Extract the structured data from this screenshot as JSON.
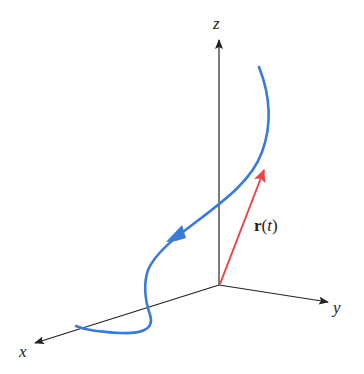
{
  "figure": {
    "axes": {
      "x_label": "x",
      "y_label": "y",
      "z_label": "z"
    },
    "vector_label": {
      "bold": "r",
      "open": "(",
      "param": "t",
      "close": ")"
    },
    "colors": {
      "axis": "#222222",
      "curve": "#3a7bd5",
      "vector": "#e8474a"
    }
  }
}
